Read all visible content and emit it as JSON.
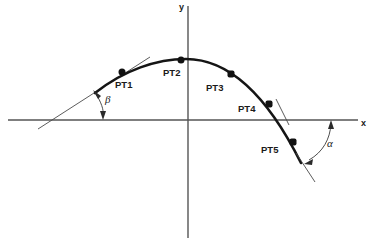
{
  "figure": {
    "type": "diagram",
    "title": "",
    "background_color": "#ffffff",
    "curve_color": "#151515",
    "axis_color": "#555555",
    "label_color": "#1a1a1a"
  },
  "axes": {
    "x_label": "x",
    "y_label": "y",
    "x_axis": {
      "y_px": 120,
      "x_start_px": 8,
      "x_end_px": 358
    },
    "y_axis": {
      "x_px": 188,
      "y_start_px": 6,
      "y_end_px": 238
    }
  },
  "points": [
    {
      "id": "PT1",
      "label": "PT1",
      "dot_x": 122,
      "dot_y": 72,
      "label_x": 115,
      "label_y": 88
    },
    {
      "id": "PT2",
      "label": "PT2",
      "dot_x": 181,
      "dot_y": 60,
      "label_x": 163,
      "label_y": 76
    },
    {
      "id": "PT3",
      "label": "PT3",
      "dot_x": 231,
      "dot_y": 74,
      "label_x": 206,
      "label_y": 91
    },
    {
      "id": "PT4",
      "label": "PT4",
      "dot_x": 269,
      "dot_y": 104,
      "label_x": 238,
      "label_y": 112
    },
    {
      "id": "PT5",
      "label": "PT5",
      "dot_x": 293,
      "dot_y": 142,
      "label_x": 261,
      "label_y": 153
    }
  ],
  "angles": [
    {
      "id": "beta",
      "label": "β",
      "label_x": 105,
      "label_y": 103,
      "description": "angle between left tangent line and x-axis"
    },
    {
      "id": "alpha",
      "label": "α",
      "label_x": 327,
      "label_y": 147,
      "description": "angle between x-axis and right tangent line"
    }
  ],
  "curve": {
    "description": "parabolic arc rising from lower-left, peaking above origin, descending through x-axis to lower-right",
    "start_px": [
      95,
      93
    ],
    "apex_px": [
      186,
      59
    ],
    "x_crossing_px": [
      274,
      120
    ],
    "end_px": [
      301,
      163
    ]
  },
  "tangent_lines": [
    {
      "id": "left-tangent",
      "from_px": [
        38,
        129
      ],
      "to_px": [
        150,
        57
      ]
    },
    {
      "id": "pt4-tangent-tick",
      "from_px": [
        275,
        99
      ],
      "to_px": [
        288,
        124
      ]
    },
    {
      "id": "right-tangent",
      "from_px": [
        297,
        155
      ],
      "to_px": [
        314,
        181
      ]
    }
  ]
}
